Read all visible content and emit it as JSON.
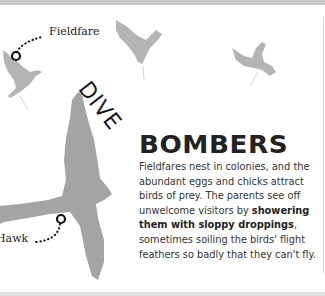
{
  "labels": {
    "fieldfare": "Fieldfare",
    "hawk": "Hawk"
  },
  "heading": {
    "kicker": "DIVE",
    "title": "BOMBERS"
  },
  "body": {
    "part1": "Fieldfares nest in colonies, and the abundant eggs and chicks attract birds of prey. The parents see off unwelcome visitors by ",
    "bold": "showering them with sloppy droppings",
    "part2": ", sometimes soiling the birds' flight feathers so badly that they can't fly."
  },
  "colors": {
    "bird_silhouette": "#a8a8a8",
    "text": "#333333",
    "marker": "#111111"
  }
}
